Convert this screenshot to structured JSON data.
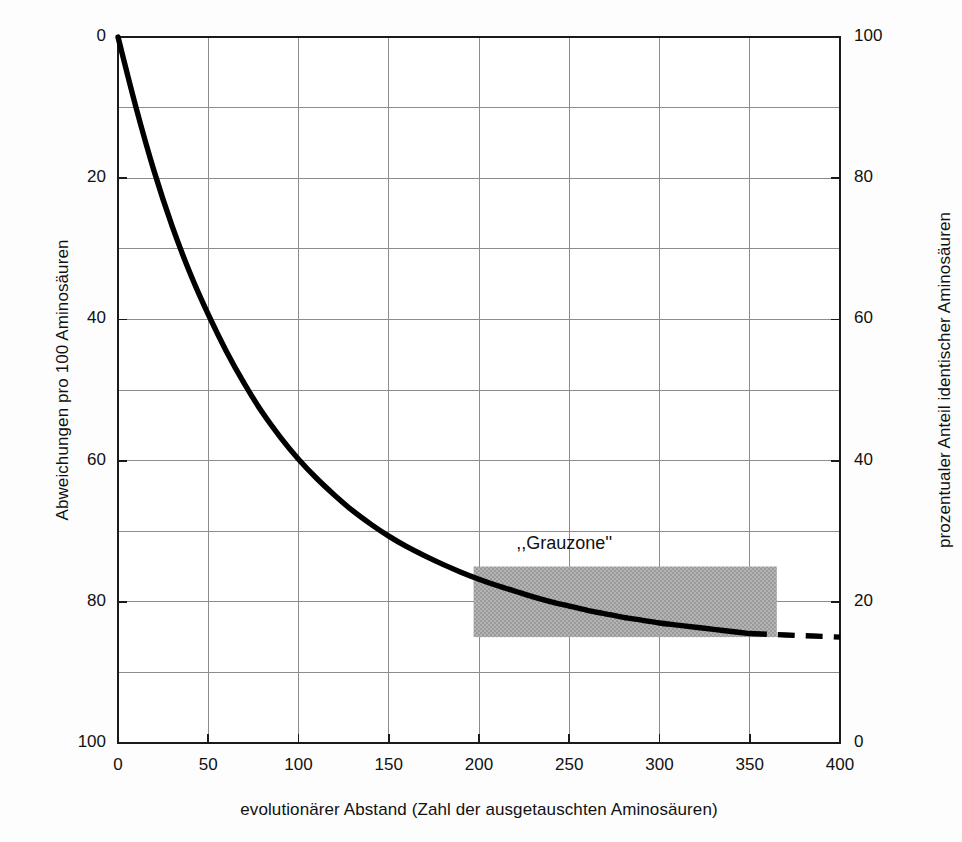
{
  "chart_data": {
    "type": "line",
    "title": "",
    "xlabel": "evolutionärer Abstand (Zahl der ausgetauschten Aminosäuren)",
    "ylabel": "Abweichungen pro 100 Aminosäuren",
    "ylabel_right": "prozentualer Anteil identischer Aminosäuren",
    "xlim": [
      0,
      400
    ],
    "ylim": [
      0,
      100
    ],
    "ylim_right": [
      0,
      100
    ],
    "y_inverted": true,
    "y_right_inverted": false,
    "grid": true,
    "legend": false,
    "xticks": [
      0,
      50,
      100,
      150,
      200,
      250,
      300,
      350,
      400
    ],
    "xtick_labels": [
      "0",
      "50",
      "100",
      "150",
      "200",
      "250",
      "300",
      "350",
      "400"
    ],
    "yticks": [
      0,
      20,
      40,
      60,
      80,
      100
    ],
    "ytick_labels": [
      "0",
      "20",
      "40",
      "60",
      "80",
      "100"
    ],
    "yticks_right": [
      0,
      20,
      40,
      60,
      80,
      100
    ],
    "ytick_labels_right": [
      "0",
      "20",
      "40",
      "60",
      "80",
      "100"
    ],
    "x_minor_step": 50,
    "y_minor_step": 10,
    "series": [
      {
        "name": "Abweichungen",
        "style": "solid",
        "color": "#000000",
        "x": [
          0,
          10,
          20,
          30,
          40,
          50,
          60,
          70,
          80,
          90,
          100,
          110,
          120,
          130,
          140,
          150,
          160,
          170,
          180,
          190,
          200,
          210,
          220,
          230,
          240,
          250,
          260,
          270,
          280,
          290,
          300,
          310,
          320,
          330,
          340,
          350
        ],
        "y": [
          0,
          10.0,
          19.0,
          26.8,
          33.5,
          39.3,
          44.5,
          49.1,
          53.2,
          56.7,
          59.8,
          62.5,
          64.9,
          67.1,
          69.0,
          70.7,
          72.2,
          73.5,
          74.7,
          75.8,
          76.8,
          77.7,
          78.5,
          79.3,
          80.0,
          80.6,
          81.2,
          81.7,
          82.2,
          82.6,
          83.0,
          83.3,
          83.6,
          83.9,
          84.2,
          84.5
        ]
      },
      {
        "name": "Abweichungen (extrapoliert)",
        "style": "dashed",
        "color": "#000000",
        "x": [
          350,
          360,
          370,
          380,
          390,
          400
        ],
        "y": [
          84.5,
          84.6,
          84.7,
          84.8,
          84.9,
          85.0
        ]
      }
    ],
    "annotations": [
      {
        "name": "grauzone-label",
        "text": ",,Grauzone''",
        "x": 255,
        "y": 72
      }
    ],
    "shaded_regions": [
      {
        "name": "grauzone-box",
        "label": "Grauzone",
        "x_start": 197,
        "x_end": 365,
        "y_start": 75,
        "y_end": 85,
        "color": "#a8a8a8"
      }
    ]
  },
  "colors": {
    "background": "#fdfdfd",
    "axis": "#1a1a1a",
    "grid": "#8c8c8c",
    "curve": "#000000",
    "shade": "#a8a8a8"
  }
}
